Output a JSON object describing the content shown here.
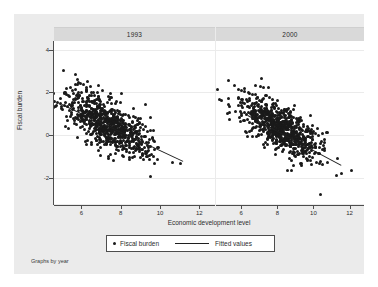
{
  "figure": {
    "note": "Graphs by year",
    "background_color": "#ffffff",
    "graph_region_color": "#ebebeb",
    "panel_background_color": "#ffffff",
    "marker_color": "#1a1a1a",
    "line_color": "#1f1f1f",
    "axis_color": "#4d4d4d"
  },
  "legend": {
    "points_label": "Fiscal burden",
    "line_label": "Fitted values"
  },
  "chart_data": {
    "type": "scatter",
    "title": "",
    "xlabel": "Economic development level",
    "ylabel": "Fiscal burden",
    "xlim": [
      4.6,
      12.8
    ],
    "ylim": [
      -3.2,
      4.4
    ],
    "xticks": [
      6,
      8,
      10,
      12
    ],
    "xticklabels": [
      "6",
      "8",
      "10",
      "12"
    ],
    "yticks": [
      -2,
      0,
      2,
      4
    ],
    "yticklabels": [
      "-2",
      "0",
      "2",
      "4"
    ],
    "grid": "horizontal",
    "legend_position": "bottom-center",
    "facet_by": "year",
    "panels": [
      {
        "label": "1993",
        "n_points": 760,
        "fit": {
          "slope": -0.43,
          "intercept": 3.62,
          "x_start": 5.0,
          "x_end": 11.2
        },
        "cloud": {
          "x_center": 7.3,
          "y_center": 0.52,
          "x_sd": 1.12,
          "y_sd": 0.8,
          "correlation": -0.68
        },
        "seed": 20231
      },
      {
        "label": "2000",
        "n_points": 760,
        "fit": {
          "slope": -0.45,
          "intercept": 3.85,
          "x_start": 6.4,
          "x_end": 11.6
        },
        "cloud": {
          "x_center": 8.1,
          "y_center": 0.4,
          "x_sd": 1.18,
          "y_sd": 0.78,
          "correlation": -0.72
        },
        "seed": 77412
      }
    ]
  }
}
